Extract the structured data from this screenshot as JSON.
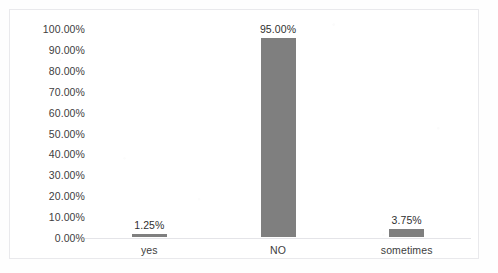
{
  "chart_data": {
    "type": "bar",
    "title": "",
    "subtitle": "",
    "xlabel": "",
    "ylabel": "",
    "categories": [
      "yes",
      "NO",
      "sometimes"
    ],
    "values": [
      1.25,
      95.0,
      3.75
    ],
    "data_labels": [
      "1.25%",
      "95.00%",
      "3.75%"
    ],
    "ylim": [
      0,
      100
    ],
    "ytick_values": [
      0,
      10,
      20,
      30,
      40,
      50,
      60,
      70,
      80,
      90,
      100
    ],
    "ytick_labels": [
      "0.00%",
      "10.00%",
      "20.00%",
      "30.00%",
      "40.00%",
      "50.00%",
      "60.00%",
      "70.00%",
      "80.00%",
      "90.00%",
      "100.00%"
    ],
    "grid": false,
    "legend": false,
    "legend_position": "none",
    "bar_color": "#7f7f7f",
    "axis_color": "#e4e4e8",
    "plot_background": "#ffffff",
    "frame_border_color": "#e9e9ec"
  }
}
